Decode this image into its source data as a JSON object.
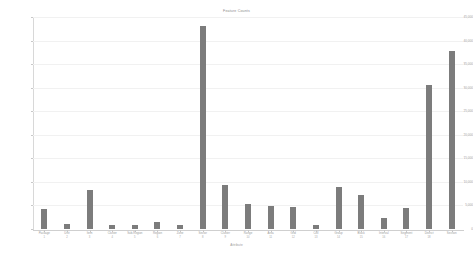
{
  "chart_data": {
    "type": "bar",
    "title": "Feature Counts",
    "xlabel": "Attribute",
    "ylabel": "",
    "ylim": [
      0,
      45000
    ],
    "grid": true,
    "legend": false,
    "bar_color": "#7c7c7c",
    "categories": [
      "Package",
      "Unit",
      "Item",
      "Cluster",
      "Sub-Region",
      "Region",
      "Zone",
      "Sector",
      "Cluster",
      "Range",
      "Area",
      "Grid",
      "Cell",
      "Group",
      "Block",
      "Interval",
      "Segment",
      "District",
      "Section"
    ],
    "sublabels": [
      "1",
      "2",
      "3",
      "4",
      "5",
      "6",
      "7",
      "8",
      "9",
      "10",
      "11",
      "12",
      "13",
      "14",
      "15",
      "16",
      "17",
      "18"
    ],
    "values": [
      4200,
      1100,
      8300,
      800,
      900,
      1500,
      900,
      43000,
      9400,
      5300,
      4900,
      4600,
      900,
      8900,
      7200,
      2400,
      4500,
      30500,
      37800
    ],
    "yticks": [
      0,
      5000,
      10000,
      15000,
      20000,
      25000,
      30000,
      35000,
      40000,
      45000
    ],
    "ytick_labels": [
      "0",
      "5,000",
      "10,000",
      "15,000",
      "20,000",
      "25,000",
      "30,000",
      "35,000",
      "40,000",
      "45,000"
    ]
  }
}
